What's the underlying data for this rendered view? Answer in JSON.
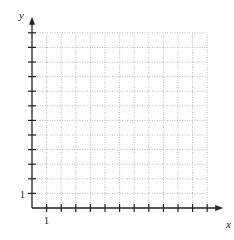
{
  "chart_data": {
    "type": "scatter",
    "title": "",
    "xlabel": "x",
    "ylabel": "y",
    "xlim": [
      0,
      12
    ],
    "ylim": [
      0,
      12
    ],
    "grid": true,
    "grid_style": "dotted",
    "x_tick_count": 12,
    "y_tick_count": 12,
    "x_tick_labels": [
      "1"
    ],
    "y_tick_labels": [
      "1"
    ],
    "series": []
  },
  "axes": {
    "x_label": "x",
    "y_label": "y",
    "x_one": "1",
    "y_one": "1"
  },
  "colors": {
    "axis": "#222222",
    "grid": "#b8b8b8"
  }
}
